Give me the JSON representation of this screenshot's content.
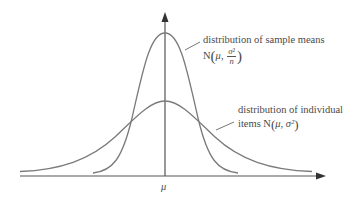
{
  "diagram": {
    "axis_label": "μ",
    "labels": {
      "sample_means": {
        "line1": "distribution of sample means",
        "prefix": "N",
        "mu": "μ",
        "sep": ",",
        "num": "σ²",
        "den": "n"
      },
      "individual": {
        "line1": "distribution of individual",
        "line2_prefix": "items N",
        "mu": "μ",
        "sep": ", ",
        "sigma2": "σ²"
      }
    },
    "colors": {
      "curve": "#7a7a7a",
      "axis": "#555555",
      "text": "#4a4a4a"
    }
  }
}
